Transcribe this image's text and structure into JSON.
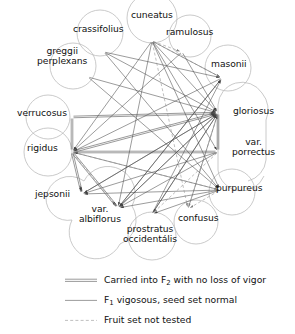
{
  "diagram": {
    "type": "crossing-compatibility-network",
    "title": "",
    "nodes": [
      {
        "id": "cuneatus",
        "label": "cuneatus",
        "cx": 152,
        "cy": 18,
        "shape": "circle",
        "r": 25,
        "hub_x": 152,
        "hub_y": 41,
        "label_x": 152,
        "label_y": 15
      },
      {
        "id": "crassifolius",
        "label": "crassifolius",
        "cx": 100,
        "cy": 33,
        "shape": "circle",
        "r": 23,
        "hub_x": 104,
        "hub_y": 52,
        "label_x": 98,
        "label_y": 29
      },
      {
        "id": "ramulosus",
        "label": "ramulosus",
        "cx": 190,
        "cy": 36,
        "shape": "circle",
        "r": 21,
        "hub_x": 182,
        "hub_y": 52,
        "label_x": 189,
        "label_y": 32
      },
      {
        "id": "greggii_perplexans",
        "label": "greggii\nperplexans",
        "cx": 73,
        "cy": 66,
        "shape": "circle",
        "r": 23,
        "hub_x": 88,
        "hub_y": 77,
        "label_x": 62,
        "label_y": 56
      },
      {
        "id": "masonii",
        "label": "masonii",
        "cx": 228,
        "cy": 68,
        "shape": "circle",
        "r": 23,
        "hub_x": 222,
        "hub_y": 78,
        "label_x": 229,
        "label_y": 64
      },
      {
        "id": "verrucosus",
        "label": "verrucosus",
        "cx": 48,
        "cy": 117,
        "shape": "circle",
        "r": 22,
        "hub_x": 72,
        "hub_y": 117,
        "label_x": 42,
        "label_y": 113
      },
      {
        "id": "gloriosus",
        "label": "gloriosus",
        "cx": 240,
        "cy": 115,
        "shape": "capsule",
        "r": 24,
        "hub_x": 218,
        "hub_y": 113,
        "label_x": 253,
        "label_y": 111
      },
      {
        "id": "rigidus",
        "label": "rigidus",
        "cx": 48,
        "cy": 152,
        "shape": "circle",
        "r": 24,
        "hub_x": 72,
        "hub_y": 152,
        "label_x": 42,
        "label_y": 148
      },
      {
        "id": "var_porrectus",
        "label": "var.\nporrectus",
        "cx": 240,
        "cy": 155,
        "shape": "capsule-lower",
        "r": 24,
        "hub_x": 218,
        "hub_y": 152,
        "label_x": 253,
        "label_y": 147
      },
      {
        "id": "jepsonii",
        "label": "jepsonii",
        "cx": 60,
        "cy": 198,
        "shape": "blob",
        "r": 22,
        "hub_x": 82,
        "hub_y": 194,
        "label_x": 52,
        "label_y": 194
      },
      {
        "id": "purpureus",
        "label": "purpureus",
        "cx": 232,
        "cy": 192,
        "shape": "circle",
        "r": 23,
        "hub_x": 220,
        "hub_y": 190,
        "label_x": 239,
        "label_y": 188
      },
      {
        "id": "var_albiflorus",
        "label": "var.\nalbiflorus",
        "cx": 104,
        "cy": 223,
        "shape": "blob-lower",
        "r": 24,
        "hub_x": 118,
        "hub_y": 208,
        "label_x": 100,
        "label_y": 214
      },
      {
        "id": "confusus",
        "label": "confusus",
        "cx": 196,
        "cy": 222,
        "shape": "circle",
        "r": 22,
        "hub_x": 188,
        "hub_y": 209,
        "label_x": 198,
        "label_y": 218
      },
      {
        "id": "prostratus_occidentalis",
        "label": "prostratus\noccidentális",
        "cx": 152,
        "cy": 236,
        "shape": "circle",
        "r": 24,
        "hub_x": 152,
        "hub_y": 214,
        "label_x": 150,
        "label_y": 234
      }
    ],
    "edge_styles": {
      "vigor": {
        "name": "double-line",
        "stroke": "#6e6e6e",
        "width": 0.7,
        "offset": 1.6
      },
      "normal": {
        "name": "single-line",
        "stroke": "#4a4a4a",
        "width": 0.55
      },
      "untested": {
        "name": "dashed-line",
        "stroke": "#8a8a8a",
        "width": 0.55,
        "dash": "3 2.2"
      }
    },
    "edges": [
      {
        "from": "verrucosus",
        "to": "gloriosus",
        "style": "vigor",
        "arrow": true
      },
      {
        "from": "verrucosus",
        "to": "rigidus",
        "style": "vigor",
        "arrow": false
      },
      {
        "from": "rigidus",
        "to": "gloriosus",
        "style": "vigor",
        "arrow": true
      },
      {
        "from": "rigidus",
        "to": "var_porrectus",
        "style": "vigor",
        "arrow": false
      },
      {
        "from": "rigidus",
        "to": "var_albiflorus",
        "style": "vigor",
        "arrow": true
      },
      {
        "from": "gloriosus",
        "to": "var_porrectus",
        "style": "vigor",
        "arrow": false
      },
      {
        "from": "rigidus",
        "to": "jepsonii",
        "style": "vigor",
        "arrow": true
      },
      {
        "from": "cuneatus",
        "to": "gloriosus",
        "style": "normal",
        "arrow": true
      },
      {
        "from": "cuneatus",
        "to": "masonii",
        "style": "normal",
        "arrow": true
      },
      {
        "from": "cuneatus",
        "to": "rigidus",
        "style": "normal",
        "arrow": true
      },
      {
        "from": "cuneatus",
        "to": "purpureus",
        "style": "normal",
        "arrow": true
      },
      {
        "from": "cuneatus",
        "to": "var_albiflorus",
        "style": "normal",
        "arrow": true
      },
      {
        "from": "cuneatus",
        "to": "var_porrectus",
        "style": "normal",
        "arrow": true
      },
      {
        "from": "crassifolius",
        "to": "gloriosus",
        "style": "normal",
        "arrow": true
      },
      {
        "from": "crassifolius",
        "to": "purpureus",
        "style": "normal",
        "arrow": true
      },
      {
        "from": "crassifolius",
        "to": "masonii",
        "style": "normal",
        "arrow": true
      },
      {
        "from": "ramulosus",
        "to": "gloriosus",
        "style": "normal",
        "arrow": true
      },
      {
        "from": "ramulosus",
        "to": "rigidus",
        "style": "normal",
        "arrow": true
      },
      {
        "from": "greggii_perplexans",
        "to": "gloriosus",
        "style": "normal",
        "arrow": true
      },
      {
        "from": "greggii_perplexans",
        "to": "purpureus",
        "style": "normal",
        "arrow": true
      },
      {
        "from": "masonii",
        "to": "rigidus",
        "style": "normal",
        "arrow": true
      },
      {
        "from": "masonii",
        "to": "var_albiflorus",
        "style": "normal",
        "arrow": true
      },
      {
        "from": "gloriosus",
        "to": "jepsonii",
        "style": "normal",
        "arrow": true
      },
      {
        "from": "gloriosus",
        "to": "var_albiflorus",
        "style": "normal",
        "arrow": true
      },
      {
        "from": "gloriosus",
        "to": "prostratus_occidentalis",
        "style": "normal",
        "arrow": true
      },
      {
        "from": "var_porrectus",
        "to": "var_albiflorus",
        "style": "normal",
        "arrow": true
      },
      {
        "from": "var_porrectus",
        "to": "jepsonii",
        "style": "normal",
        "arrow": true
      },
      {
        "from": "purpureus",
        "to": "rigidus",
        "style": "normal",
        "arrow": true
      },
      {
        "from": "purpureus",
        "to": "jepsonii",
        "style": "normal",
        "arrow": true
      },
      {
        "from": "purpureus",
        "to": "var_albiflorus",
        "style": "normal",
        "arrow": true
      },
      {
        "from": "purpureus",
        "to": "prostratus_occidentalis",
        "style": "normal",
        "arrow": true
      },
      {
        "from": "prostratus_occidentalis",
        "to": "gloriosus",
        "style": "normal",
        "arrow": true
      },
      {
        "from": "prostratus_occidentalis",
        "to": "masonii",
        "style": "normal",
        "arrow": true
      },
      {
        "from": "var_albiflorus",
        "to": "gloriosus",
        "style": "normal",
        "arrow": true
      },
      {
        "from": "var_albiflorus",
        "to": "masonii",
        "style": "normal",
        "arrow": true
      },
      {
        "from": "confusus",
        "to": "gloriosus",
        "style": "normal",
        "arrow": true
      },
      {
        "from": "jepsonii",
        "to": "gloriosus",
        "style": "normal",
        "arrow": true
      },
      {
        "from": "cuneatus",
        "to": "ramulosus",
        "style": "untested",
        "arrow": true
      },
      {
        "from": "cuneatus",
        "to": "masonii",
        "style": "untested",
        "arrow": true
      },
      {
        "from": "cuneatus",
        "to": "confusus",
        "style": "untested",
        "arrow": true
      },
      {
        "from": "rigidus",
        "to": "var_albiflorus",
        "style": "untested",
        "arrow": true
      },
      {
        "from": "gloriosus",
        "to": "confusus",
        "style": "untested",
        "arrow": true
      },
      {
        "from": "purpureus",
        "to": "confusus",
        "style": "untested",
        "arrow": true
      },
      {
        "from": "var_porrectus",
        "to": "prostratus_occidentalis",
        "style": "untested",
        "arrow": true
      },
      {
        "from": "rigidus",
        "to": "purpureus",
        "style": "untested",
        "arrow": true
      }
    ]
  },
  "legend": {
    "items": [
      {
        "id": "vigor",
        "style": "vigor",
        "text_before": "Carried into F",
        "sub": "2",
        "text_after": " with no loss of vigor"
      },
      {
        "id": "normal",
        "style": "normal",
        "text_before": "F",
        "sub": "1",
        "text_after": " vigosous, seed set normal"
      },
      {
        "id": "untested",
        "style": "untested",
        "text_before": "Fruit set not tested",
        "sub": "",
        "text_after": ""
      }
    ]
  },
  "colors": {
    "node_outline": "#b8b8b8",
    "edge_gray": "#6e6e6e",
    "edge_dark": "#4a4a4a",
    "edge_dash": "#8a8a8a",
    "text": "#111111",
    "background": "#ffffff"
  }
}
